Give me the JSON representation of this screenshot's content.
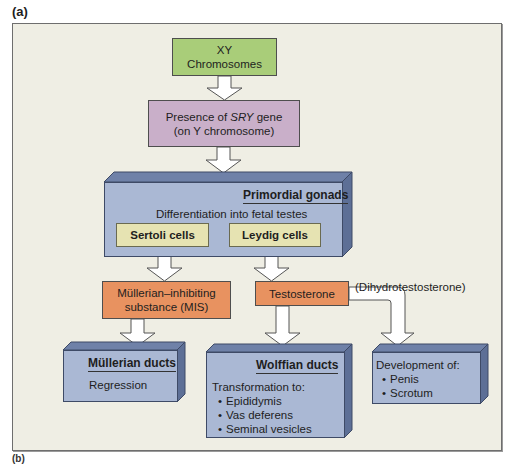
{
  "panel_label": "(a)",
  "panel_label_next": "(b)",
  "colors": {
    "frame_bg": "#efeee4",
    "xy_box": "#a9cd79",
    "sry_box": "#c9afc9",
    "blue_box": "#aab8d4",
    "tan_box": "#e6e3b2",
    "orange_box": "#e89260",
    "arrow_fill": "#ffffff"
  },
  "nodes": {
    "xy": {
      "line1": "XY",
      "line2": "Chromosomes"
    },
    "sry": {
      "prefix": "Presence of ",
      "gene": "SRY",
      "suffix": " gene",
      "line2": "(on Y chromosome)"
    },
    "primordial_gonads": {
      "title": "Primordial gonads",
      "subtitle": "Differentiation into fetal testes",
      "sertoli": "Sertoli cells",
      "leydig": "Leydig cells"
    },
    "mis": {
      "line1": "Müllerian–inhibiting",
      "line2": "substance (MIS)"
    },
    "testosterone": {
      "label": "Testosterone"
    },
    "dht": {
      "label": "(Dihydrotestosterone)"
    },
    "mullerian_ducts": {
      "title": "Müllerian ducts",
      "text": "Regression"
    },
    "wolffian_ducts": {
      "title": "Wolffian ducts",
      "intro": "Transformation to:",
      "items": [
        "Epididymis",
        "Vas deferens",
        "Seminal vesicles"
      ]
    },
    "development": {
      "intro": "Development of:",
      "items": [
        "Penis",
        "Scrotum"
      ]
    }
  },
  "edges": [
    [
      "XY Chromosomes",
      "Presence of SRY gene"
    ],
    [
      "Presence of SRY gene",
      "Primordial gonads"
    ],
    [
      "Sertoli cells",
      "Müllerian-inhibiting substance (MIS)"
    ],
    [
      "Leydig cells",
      "Testosterone"
    ],
    [
      "Müllerian-inhibiting substance (MIS)",
      "Müllerian ducts"
    ],
    [
      "Testosterone",
      "Wolffian ducts"
    ],
    [
      "Testosterone",
      "Development of penis/scrotum (via Dihydrotestosterone)"
    ]
  ]
}
